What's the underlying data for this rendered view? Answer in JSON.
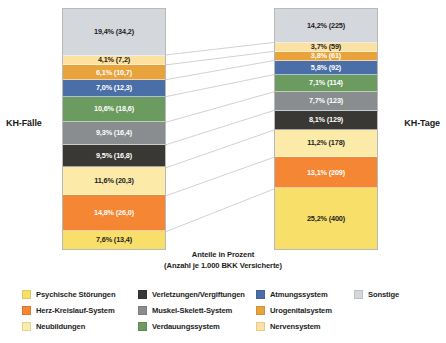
{
  "chart_data": {
    "type": "bar",
    "title": "",
    "xlabel": "Anteile in Prozent",
    "ylabel": "",
    "subtitle": "(Anzahl je 1.000 BKK Versicherte)",
    "stacked": true,
    "categories": [
      "KH-Fälle",
      "KH-Tage"
    ],
    "series": [
      {
        "name": "Sonstige",
        "color": "#d4d7dc",
        "values": [
          19.4,
          14.2
        ],
        "counts": [
          "34,2",
          "225"
        ],
        "labels": [
          "19,4% (34,2)",
          "14,2% (225)"
        ]
      },
      {
        "name": "Nervensystem",
        "color": "#fde1a0",
        "values": [
          4.1,
          3.7
        ],
        "counts": [
          "7,2",
          "59"
        ],
        "labels": [
          "4,1% (7,2)",
          "3,7% (59)"
        ]
      },
      {
        "name": "Urogenitalsystem",
        "color": "#e8a33d",
        "values": [
          6.1,
          3.8
        ],
        "counts": [
          "10,7",
          "61"
        ],
        "labels": [
          "6,1% (10,7)",
          "3,8% (61)"
        ]
      },
      {
        "name": "Atmungssystem",
        "color": "#4a6fa8",
        "values": [
          7.0,
          5.8
        ],
        "counts": [
          "12,3",
          "92"
        ],
        "labels": [
          "7,0% (12,3)",
          "5,8% (92)"
        ]
      },
      {
        "name": "Verdauungssystem",
        "color": "#6b9b5f",
        "values": [
          10.6,
          7.1
        ],
        "counts": [
          "18,6",
          "114"
        ],
        "labels": [
          "10,6% (18,6)",
          "7,1% (114)"
        ]
      },
      {
        "name": "Muskel-Skelett-System",
        "color": "#8a8d8f",
        "values": [
          9.3,
          7.7
        ],
        "counts": [
          "16,4",
          "123"
        ],
        "labels": [
          "9,3% (16,4)",
          "7,7% (123)"
        ]
      },
      {
        "name": "Verletzungen/Vergiftungen",
        "color": "#3a3834",
        "values": [
          9.5,
          8.1
        ],
        "counts": [
          "16,8",
          "129"
        ],
        "labels": [
          "9,5% (16,8)",
          "8,1% (129)"
        ]
      },
      {
        "name": "Neubildungen",
        "color": "#fbeaa8",
        "values": [
          11.6,
          11.2
        ],
        "counts": [
          "20,3",
          "178"
        ],
        "labels": [
          "11,6% (20,3)",
          "11,2% (178)"
        ]
      },
      {
        "name": "Herz-Kreislauf-System",
        "color": "#f58634",
        "values": [
          14.8,
          13.1
        ],
        "counts": [
          "26,0",
          "209"
        ],
        "labels": [
          "14,8% (26,0)",
          "13,1% (209)"
        ]
      },
      {
        "name": "Psychische Störungen",
        "color": "#f8df6a",
        "values": [
          7.6,
          25.2
        ],
        "counts": [
          "13,4",
          "400"
        ],
        "labels": [
          "7,6% (13,4)",
          "25,2% (400)"
        ]
      }
    ],
    "legend_position": "bottom",
    "grid": false
  },
  "axis": {
    "title_line1": "Anteile in Prozent",
    "title_line2": "(Anzahl je 1.000 BKK Versicherte)"
  },
  "columns": {
    "left": {
      "label": "KH-Fälle",
      "segments": [
        {
          "name": "Sonstige",
          "label": "19,4% (34,2)",
          "percent": 19.4,
          "color": "#d4d7dc",
          "text": "dark"
        },
        {
          "name": "Nervensystem",
          "label": "4,1% (7,2)",
          "percent": 4.1,
          "color": "#fde1a0",
          "text": "dark"
        },
        {
          "name": "Urogenitalsystem",
          "label": "6,1% (10,7)",
          "percent": 6.1,
          "color": "#e8a33d",
          "text": "light"
        },
        {
          "name": "Atmungssystem",
          "label": "7,0% (12,3)",
          "percent": 7.0,
          "color": "#4a6fa8",
          "text": "light"
        },
        {
          "name": "Verdauungssystem",
          "label": "10,6% (18,6)",
          "percent": 10.6,
          "color": "#6b9b5f",
          "text": "light"
        },
        {
          "name": "Muskel-Skelett-System",
          "label": "9,3% (16,4)",
          "percent": 9.3,
          "color": "#8a8d8f",
          "text": "light"
        },
        {
          "name": "Verletzungen/Vergiftungen",
          "label": "9,5% (16,8)",
          "percent": 9.5,
          "color": "#3a3834",
          "text": "light"
        },
        {
          "name": "Neubildungen",
          "label": "11,6% (20,3)",
          "percent": 11.6,
          "color": "#fbeaa8",
          "text": "dark"
        },
        {
          "name": "Herz-Kreislauf-System",
          "label": "14,8% (26,0)",
          "percent": 14.8,
          "color": "#f58634",
          "text": "light"
        },
        {
          "name": "Psychische Störungen",
          "label": "7,6% (13,4)",
          "percent": 7.6,
          "color": "#f8df6a",
          "text": "dark"
        }
      ]
    },
    "right": {
      "label": "KH-Tage",
      "segments": [
        {
          "name": "Sonstige",
          "label": "14,2% (225)",
          "percent": 14.2,
          "color": "#d4d7dc",
          "text": "dark"
        },
        {
          "name": "Nervensystem",
          "label": "3,7% (59)",
          "percent": 3.7,
          "color": "#fde1a0",
          "text": "dark"
        },
        {
          "name": "Urogenitalsystem",
          "label": "3,8% (61)",
          "percent": 3.8,
          "color": "#e8a33d",
          "text": "light"
        },
        {
          "name": "Atmungssystem",
          "label": "5,8% (92)",
          "percent": 5.8,
          "color": "#4a6fa8",
          "text": "light"
        },
        {
          "name": "Verdauungssystem",
          "label": "7,1% (114)",
          "percent": 7.1,
          "color": "#6b9b5f",
          "text": "light"
        },
        {
          "name": "Muskel-Skelett-System",
          "label": "7,7% (123)",
          "percent": 7.7,
          "color": "#8a8d8f",
          "text": "light"
        },
        {
          "name": "Verletzungen/Vergiftungen",
          "label": "8,1% (129)",
          "percent": 8.1,
          "color": "#3a3834",
          "text": "light"
        },
        {
          "name": "Neubildungen",
          "label": "11,2% (178)",
          "percent": 11.2,
          "color": "#fbeaa8",
          "text": "dark"
        },
        {
          "name": "Herz-Kreislauf-System",
          "label": "13,1% (209)",
          "percent": 13.1,
          "color": "#f58634",
          "text": "light"
        },
        {
          "name": "Psychische Störungen",
          "label": "25,2% (400)",
          "percent": 25.2,
          "color": "#f8df6a",
          "text": "dark"
        }
      ]
    }
  },
  "legend": {
    "columns": [
      [
        {
          "label": "Psychische Störungen",
          "color": "#f8df6a"
        },
        {
          "label": "Herz-Kreislauf-System",
          "color": "#f58634"
        },
        {
          "label": "Neubildungen",
          "color": "#fbeaa8"
        }
      ],
      [
        {
          "label": "Verletzungen/Vergiftungen",
          "color": "#3a3834"
        },
        {
          "label": "Muskel-Skelett-System",
          "color": "#8a8d8f"
        },
        {
          "label": "Verdauungssystem",
          "color": "#6b9b5f"
        }
      ],
      [
        {
          "label": "Atmungssystem",
          "color": "#4a6fa8"
        },
        {
          "label": "Urogenitalsystem",
          "color": "#e8a33d"
        },
        {
          "label": "Nervensystem",
          "color": "#fde1a0"
        }
      ],
      [
        {
          "label": "Sonstige",
          "color": "#d4d7dc"
        }
      ]
    ]
  }
}
